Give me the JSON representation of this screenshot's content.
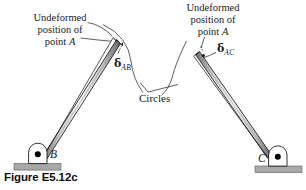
{
  "figure": {
    "caption": "Figure E5.12c",
    "labels": {
      "left_block": {
        "line1": "Undeformed",
        "line2": "position of",
        "line3_prefix": "point ",
        "line3_point": "A"
      },
      "right_block": {
        "line1": "Undeformed",
        "line2": "position of",
        "line3_prefix": "point ",
        "line3_point": "A"
      },
      "delta_ab": {
        "symbol": "δ",
        "subscript": "AB"
      },
      "delta_ac": {
        "symbol": "δ",
        "subscript": "AC"
      },
      "circles": "Circles",
      "support_b": "B",
      "support_c": "C"
    },
    "colors": {
      "line": "#1a1a1a",
      "bar_fill": "#d0d0d0",
      "bar_highlight": "#f2f2f2",
      "ground_fill": "#a8a8a8",
      "support_fill": "#ffffff",
      "pin_fill": "#000000",
      "background": "#ffffff"
    }
  }
}
